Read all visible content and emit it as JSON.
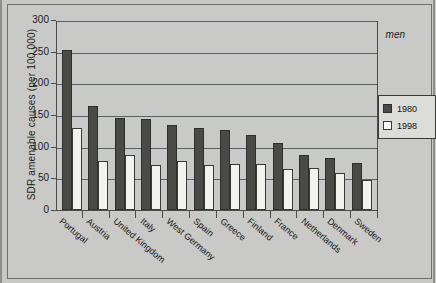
{
  "chart_data": {
    "type": "bar",
    "title": "",
    "annotation": "men",
    "xlabel": "",
    "ylabel": "SDR amenable causes (per 100,000)",
    "ylim": [
      0,
      300
    ],
    "yticks": [
      0,
      50,
      100,
      150,
      200,
      250,
      300
    ],
    "grid": true,
    "legend_position": "right",
    "categories": [
      "Portugal",
      "Austria",
      "United Kingdom",
      "Italy",
      "West Germany",
      "Spain",
      "Greece",
      "Finland",
      "France",
      "Netherlands",
      "Denmark",
      "Sweden"
    ],
    "series": [
      {
        "name": "1980",
        "color": "#4a4a47",
        "values": [
          252,
          165,
          146,
          144,
          135,
          129,
          127,
          118,
          106,
          87,
          82,
          75
        ]
      },
      {
        "name": "1998",
        "color": "#f2f2ef",
        "values": [
          130,
          78,
          87,
          71,
          78,
          71,
          73,
          72,
          65,
          67,
          59,
          47
        ]
      }
    ]
  },
  "legend": {
    "entries": [
      {
        "label": "1980"
      },
      {
        "label": "1998"
      }
    ]
  }
}
